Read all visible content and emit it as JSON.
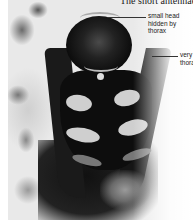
{
  "heading": {
    "text": "The short antennae"
  },
  "figure": {
    "annotations": [
      {
        "id": "head",
        "lines": [
          "small head",
          "hidden by",
          "thorax"
        ]
      },
      {
        "id": "thorax",
        "lines": [
          "very",
          "thorax"
        ]
      }
    ]
  },
  "colors": {
    "text": "#222222",
    "background": "#ffffff",
    "insect_body": "#0d0d0d",
    "abdomen_spots": "#cfcfcf"
  }
}
